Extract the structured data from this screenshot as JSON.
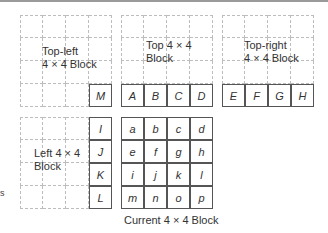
{
  "blocks": {
    "top_left": {
      "label": "Top-left\n4 × 4 Block",
      "edge_cell": "M"
    },
    "top": {
      "label": "Top 4 × 4\nBlock",
      "edge_cells": [
        "A",
        "B",
        "C",
        "D"
      ]
    },
    "top_right": {
      "label": "Top-right\n4 × 4 Block",
      "edge_cells": [
        "E",
        "F",
        "G",
        "H"
      ]
    },
    "left": {
      "label": "Left 4 × 4\nBlock",
      "edge_cells": [
        "I",
        "J",
        "K",
        "L"
      ]
    },
    "current": {
      "caption": "Current 4 × 4 Block",
      "cells": [
        "a",
        "b",
        "c",
        "d",
        "e",
        "f",
        "g",
        "h",
        "i",
        "j",
        "k",
        "l",
        "m",
        "n",
        "o",
        "p"
      ]
    }
  },
  "edge_artifact": "s"
}
